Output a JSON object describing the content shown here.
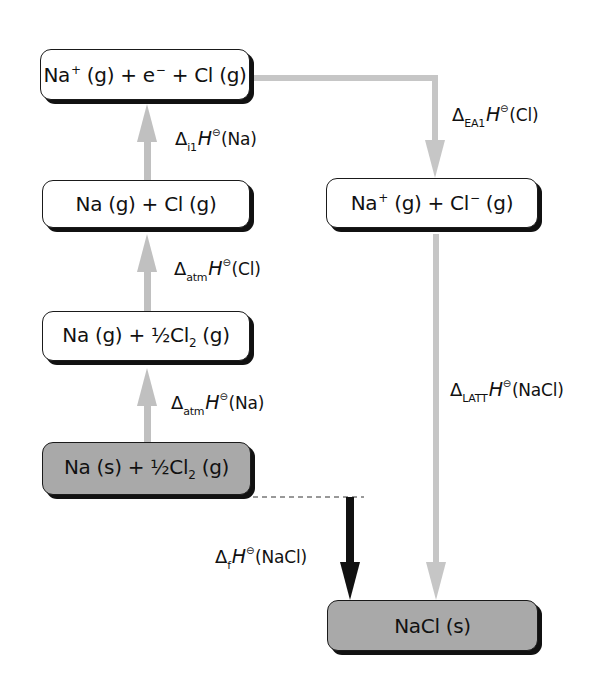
{
  "diagram": {
    "colors": {
      "state_box_fill": "#ffffff",
      "reference_box_fill": "#a9a9a9",
      "step_arrow": "#c0c0c0",
      "formation_arrow": "#111111",
      "box_shadow": "#111111"
    },
    "states": [
      {
        "id": "ionised",
        "parts": {
          "a": "Na",
          "a_sup": "+",
          "b": " (g) + e",
          "b_sup": "−",
          "c": " + Cl (g)"
        },
        "fill": "white"
      },
      {
        "id": "gaseous_atoms",
        "text": "Na (g) + Cl (g)",
        "fill": "white"
      },
      {
        "id": "atomised_na",
        "parts": {
          "a": "Na (g) + ½Cl",
          "a_sub": "2",
          "b": " (g)"
        },
        "fill": "white"
      },
      {
        "id": "elements",
        "parts": {
          "a": "Na (s) + ½Cl",
          "a_sub": "2",
          "b": " (g)"
        },
        "fill": "gray"
      },
      {
        "id": "gaseous_ions",
        "parts": {
          "a": "Na",
          "a_sup": "+",
          "b": " (g) + Cl",
          "b_sup": "−",
          "c": " (g)"
        },
        "fill": "white"
      },
      {
        "id": "product",
        "text": "NaCl (s)",
        "fill": "gray"
      }
    ],
    "steps": [
      {
        "id": "ie1",
        "delta": "Δ",
        "sub": "i1",
        "H": "H",
        "theta": "⊖",
        "species": "(Na)",
        "direction": "up"
      },
      {
        "id": "atm_cl",
        "delta": "Δ",
        "sub": "atm",
        "H": "H",
        "theta": "⊖",
        "species": "(Cl)",
        "direction": "up"
      },
      {
        "id": "atm_na",
        "delta": "Δ",
        "sub": "atm",
        "H": "H",
        "theta": "⊖",
        "species": "(Na)",
        "direction": "up"
      },
      {
        "id": "ea1",
        "delta": "Δ",
        "sub": "EA1",
        "H": "H",
        "theta": "⊖",
        "species": "(Cl)",
        "direction": "down"
      },
      {
        "id": "latt",
        "delta": "Δ",
        "sub": "LATT",
        "H": "H",
        "theta": "⊖",
        "species": "(NaCl)",
        "direction": "down"
      },
      {
        "id": "formation",
        "delta": "Δ",
        "sub": "f",
        "H": "H",
        "theta": "⊖",
        "species": "(NaCl)",
        "direction": "down"
      }
    ]
  }
}
